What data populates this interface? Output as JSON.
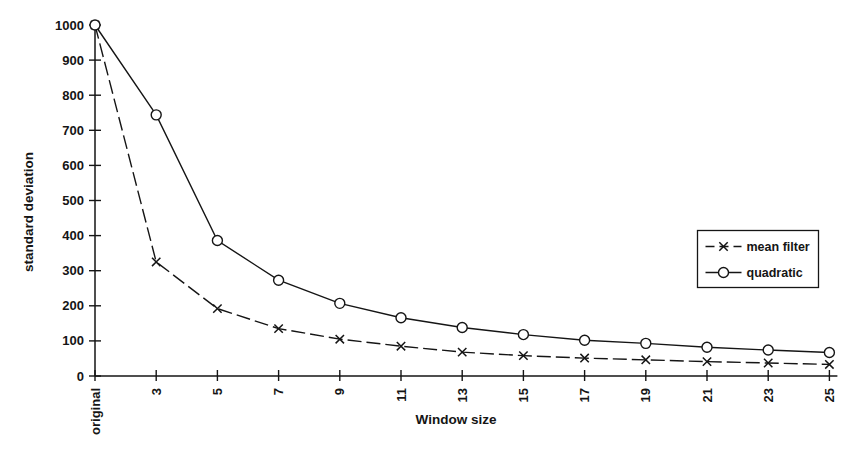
{
  "figure": {
    "background": "#ffffff",
    "ink_color": "#151515"
  },
  "chart_data": {
    "type": "line",
    "title": "",
    "xlabel": "Window size",
    "ylabel": "standard deviation",
    "categories": [
      "original",
      "3",
      "5",
      "7",
      "9",
      "11",
      "13",
      "15",
      "17",
      "19",
      "21",
      "23",
      "25"
    ],
    "ylim": [
      0,
      1000
    ],
    "ytick_step": 100,
    "grid": false,
    "legend_position": "right",
    "legend_border": true,
    "series": [
      {
        "name": "mean filter",
        "marker": "x",
        "line_style": "dashed",
        "color": "#151515",
        "values": [
          1000,
          325,
          192,
          135,
          105,
          85,
          68,
          58,
          51,
          46,
          41,
          37,
          33
        ]
      },
      {
        "name": "quadratic",
        "marker": "circle",
        "line_style": "solid",
        "color": "#151515",
        "values": [
          1000,
          744,
          386,
          273,
          207,
          166,
          138,
          118,
          102,
          93,
          82,
          74,
          67
        ]
      }
    ]
  }
}
